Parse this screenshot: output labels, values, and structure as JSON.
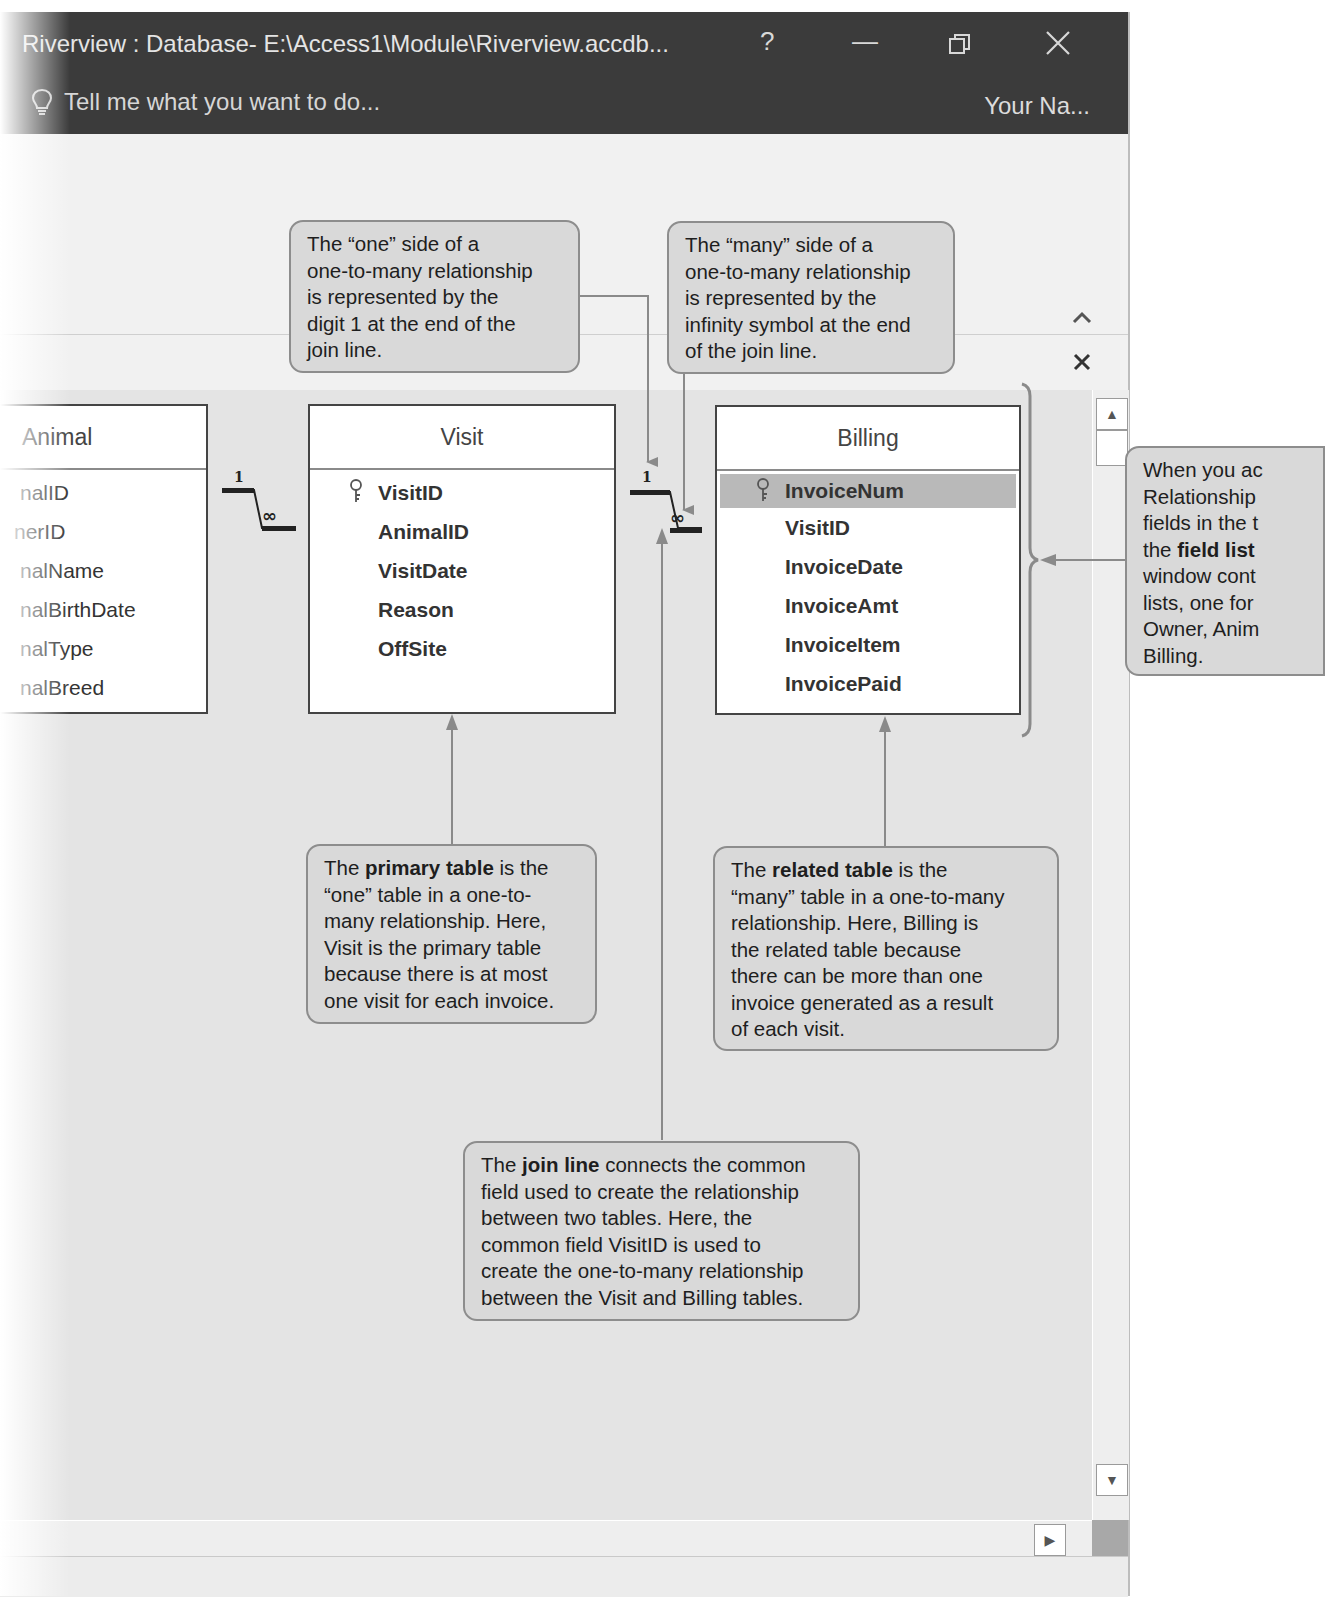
{
  "window": {
    "title": "Riverview : Database- E:\\Access1\\Module\\Riverview.accdb...",
    "controls": {
      "help": "?",
      "minimize": "—",
      "restore": "❐",
      "close": "✕"
    },
    "tell_me_placeholder": "Tell me what you want to do...",
    "user_name": "Your Na..."
  },
  "ribbon": {
    "collapse_icon": "^",
    "close_doc_icon": "✕"
  },
  "field_lists": [
    {
      "title": "Animal",
      "fields": [
        {
          "name": "AnimalID",
          "visible_text": "nalID",
          "primary_key": true
        },
        {
          "name": "OwnerID",
          "visible_text": "nerID",
          "primary_key": false
        },
        {
          "name": "AnimalName",
          "visible_text": "nalName",
          "primary_key": false
        },
        {
          "name": "AnimalBirthDate",
          "visible_text": "nalBirthDate",
          "primary_key": false
        },
        {
          "name": "AnimalType",
          "visible_text": "nalType",
          "primary_key": false
        },
        {
          "name": "AnimalBreed",
          "visible_text": "nalBreed",
          "primary_key": false
        }
      ]
    },
    {
      "title": "Visit",
      "fields": [
        {
          "name": "VisitID",
          "primary_key": true
        },
        {
          "name": "AnimalID",
          "primary_key": false
        },
        {
          "name": "VisitDate",
          "primary_key": false
        },
        {
          "name": "Reason",
          "primary_key": false
        },
        {
          "name": "OffSite",
          "primary_key": false
        }
      ]
    },
    {
      "title": "Billing",
      "fields": [
        {
          "name": "InvoiceNum",
          "primary_key": true,
          "selected": true
        },
        {
          "name": "VisitID",
          "primary_key": false
        },
        {
          "name": "InvoiceDate",
          "primary_key": false
        },
        {
          "name": "InvoiceAmt",
          "primary_key": false
        },
        {
          "name": "InvoiceItem",
          "primary_key": false
        },
        {
          "name": "InvoicePaid",
          "primary_key": false
        }
      ]
    }
  ],
  "join_lines": [
    {
      "from": "Animal",
      "to": "Visit",
      "one_label": "1",
      "many_label": "∞"
    },
    {
      "from": "Visit",
      "to": "Billing",
      "one_label": "1",
      "many_label": "∞"
    }
  ],
  "callouts": {
    "one_side": {
      "lines": [
        "The “one” side of a",
        "one-to-many relationship",
        "is represented by the",
        "digit 1 at the end of the",
        "join line."
      ]
    },
    "many_side": {
      "lines": [
        "The “many” side of a",
        "one-to-many relationship",
        "is represented by the",
        "infinity symbol at the end",
        "of the join line."
      ]
    },
    "field_list": {
      "pre": "When you ac",
      "lines": [
        "Relationship",
        "fields in the t"
      ],
      "bold_prefix": "the ",
      "bold": "field list",
      "post_lines": [
        "window cont",
        "lists, one for",
        "Owner, Anim",
        "Billing."
      ]
    },
    "primary_table": {
      "pre": "The ",
      "bold": "primary table",
      "post": " is the",
      "lines": [
        "“one” table in a one-to-",
        "many relationship. Here,",
        "Visit is the primary table",
        "because there is at most",
        "one visit for each invoice."
      ]
    },
    "related_table": {
      "pre": "The ",
      "bold": "related table",
      "post": " is the",
      "lines": [
        "“many” table in a one-to-many",
        "relationship. Here, Billing is",
        "the related table because",
        "there can be more than one",
        "invoice generated as a result",
        "of each visit."
      ]
    },
    "join_line": {
      "pre": "The ",
      "bold": "join line",
      "post": " connects the common",
      "lines": [
        "field used to create the relationship",
        "between two tables. Here, the",
        "common field VisitID is used to",
        "create the one-to-many relationship",
        "between the Visit and Billing tables."
      ]
    }
  },
  "scrollbars": {
    "up": "▲",
    "down": "▼",
    "right": "▶"
  },
  "colors": {
    "titlebar": "#3b3b3b",
    "canvas": "#e4e4e4",
    "callout_fill": "#d9d9d9",
    "callout_border": "#8d8d8d",
    "selected_field": "#b9b9b9"
  }
}
